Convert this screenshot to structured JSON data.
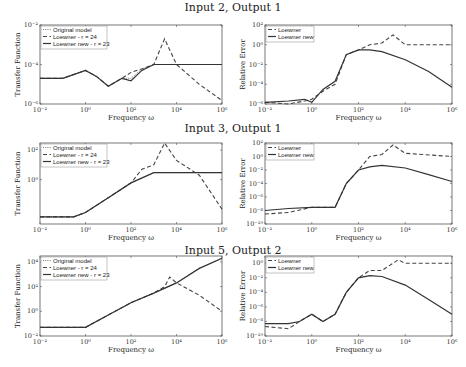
{
  "figure": {
    "rows": [
      {
        "title": "Input 2, Output 1"
      },
      {
        "title": "Input 3, Output 1"
      },
      {
        "title": "Input 5, Output 2"
      }
    ],
    "xlabel": "Frequency ω",
    "left_ylabel": "Transfer Function",
    "right_ylabel": "Relative Error",
    "left_legend": [
      "Original model",
      "Loewner - r = 24",
      "Loewner new - r = 23"
    ],
    "right_legend": [
      "Loewner",
      "Loewner new"
    ],
    "x_ticks": [
      "10⁻²",
      "10⁰",
      "10²",
      "10⁴",
      "10⁶"
    ]
  },
  "chart_data": [
    {
      "type": "line",
      "title": "Input 2, Output 1",
      "xlabel": "Frequency ω",
      "ylabel": "Transfer Function",
      "xscale": "log",
      "yscale": "log",
      "xlim": [
        0.01,
        1000000
      ],
      "ylim": [
        1e-06,
        0.01
      ],
      "y_ticks": [
        "10⁻⁶",
        "10⁻⁴",
        "10⁻²"
      ],
      "legend": [
        "Original model",
        "Loewner - r = 24",
        "Loewner new - r = 23"
      ],
      "legend_position": "upper left",
      "series": [
        {
          "name": "Original model",
          "style": "dotted",
          "x": [
            0.01,
            0.1,
            1,
            3,
            10,
            40,
            100,
            300,
            1000,
            10000,
            1000000
          ],
          "y": [
            2e-05,
            2e-05,
            5e-05,
            2.5e-05,
            8e-06,
            2e-05,
            2e-05,
            6e-05,
            0.0001,
            0.0001,
            0.0001
          ]
        },
        {
          "name": "Loewner - r = 24",
          "style": "dashed",
          "x": [
            0.01,
            0.1,
            1,
            3,
            10,
            40,
            100,
            300,
            1000,
            3000,
            10000,
            100000,
            1000000
          ],
          "y": [
            2e-05,
            2e-05,
            5e-05,
            2.5e-05,
            8e-06,
            2e-05,
            4e-05,
            6e-05,
            0.0001,
            0.002,
            0.0001,
            1e-05,
            1.5e-06
          ]
        },
        {
          "name": "Loewner new - r = 23",
          "style": "solid",
          "x": [
            0.01,
            0.1,
            1,
            3,
            10,
            40,
            100,
            300,
            1000,
            10000,
            1000000
          ],
          "y": [
            2e-05,
            2e-05,
            5e-05,
            2.5e-05,
            8e-06,
            2e-05,
            1.5e-05,
            5e-05,
            0.0001,
            0.0001,
            0.0001
          ]
        }
      ]
    },
    {
      "type": "line",
      "title": "Input 2, Output 1",
      "xlabel": "Frequency ω",
      "ylabel": "Relative Error",
      "xscale": "log",
      "yscale": "log",
      "xlim": [
        0.01,
        1000000
      ],
      "ylim": [
        1e-06,
        100
      ],
      "y_ticks": [
        "10⁻⁶",
        "10⁻⁴",
        "10⁻²",
        "10⁰",
        "10²"
      ],
      "legend": [
        "Loewner",
        "Loewner new"
      ],
      "legend_position": "upper left",
      "series": [
        {
          "name": "Loewner",
          "style": "dashed",
          "x": [
            0.01,
            0.1,
            0.5,
            1,
            3,
            10,
            30,
            100,
            300,
            1000,
            3000,
            10000,
            1000000
          ],
          "y": [
            1.5e-06,
            1e-06,
            2e-06,
            3e-06,
            2e-05,
            0.0001,
            0.1,
            0.3,
            1,
            1.5,
            10,
            1,
            1
          ]
        },
        {
          "name": "Loewner new",
          "style": "solid",
          "x": [
            0.01,
            0.1,
            0.5,
            1,
            3,
            10,
            30,
            100,
            300,
            1000,
            10000,
            100000,
            1000000
          ],
          "y": [
            1.5e-06,
            2e-06,
            3e-06,
            1.5e-06,
            3e-05,
            0.0002,
            0.1,
            0.3,
            0.3,
            0.2,
            0.03,
            0.002,
            5e-05
          ]
        }
      ]
    },
    {
      "type": "line",
      "title": "Input 3, Output 1",
      "xlabel": "Frequency ω",
      "ylabel": "Transfer Function",
      "xscale": "log",
      "yscale": "log",
      "xlim": [
        0.01,
        1000000
      ],
      "ylim": [
        0.001,
        300
      ],
      "y_ticks": [
        "10⁰",
        "10²"
      ],
      "legend": [
        "Original model",
        "Loewner - r = 24",
        "Loewner new - r = 23"
      ],
      "legend_position": "upper left",
      "series": [
        {
          "name": "Original model",
          "style": "dotted",
          "x": [
            0.01,
            0.3,
            1,
            10,
            100,
            1000,
            10000,
            1000000
          ],
          "y": [
            0.003,
            0.003,
            0.006,
            0.06,
            0.6,
            3,
            3,
            3
          ]
        },
        {
          "name": "Loewner - r = 24",
          "style": "dashed",
          "x": [
            0.01,
            0.3,
            1,
            10,
            100,
            300,
            1000,
            3000,
            10000,
            100000,
            1000000
          ],
          "y": [
            0.003,
            0.003,
            0.006,
            0.06,
            0.6,
            5,
            10,
            300,
            20,
            2,
            0.01
          ]
        },
        {
          "name": "Loewner new - r = 23",
          "style": "solid",
          "x": [
            0.01,
            0.3,
            1,
            10,
            100,
            1000,
            10000,
            1000000
          ],
          "y": [
            0.003,
            0.003,
            0.006,
            0.06,
            0.6,
            3,
            3,
            3
          ]
        }
      ]
    },
    {
      "type": "line",
      "title": "Input 3, Output 1",
      "xlabel": "Frequency ω",
      "ylabel": "Relative Error",
      "xscale": "log",
      "yscale": "log",
      "xlim": [
        0.01,
        1000000
      ],
      "ylim": [
        1e-10,
        100
      ],
      "y_ticks": [
        "10⁻¹⁰",
        "10⁻⁸",
        "10⁻⁶",
        "10⁻⁴",
        "10⁻²",
        "10⁰",
        "10²"
      ],
      "legend": [
        "Loewner",
        "Loewner new"
      ],
      "legend_position": "upper left",
      "series": [
        {
          "name": "Loewner",
          "style": "dashed",
          "x": [
            0.01,
            0.1,
            1,
            10,
            30,
            100,
            300,
            1000,
            3000,
            10000,
            1000000
          ],
          "y": [
            3e-09,
            5e-09,
            3e-08,
            3e-08,
            0.0001,
            0.01,
            1,
            2,
            50,
            3,
            1
          ]
        },
        {
          "name": "Loewner new",
          "style": "solid",
          "x": [
            0.01,
            0.1,
            1,
            10,
            30,
            100,
            300,
            1000,
            10000,
            100000,
            1000000
          ],
          "y": [
            1e-08,
            2e-08,
            3e-08,
            3e-08,
            0.0001,
            0.01,
            0.03,
            0.05,
            0.02,
            0.002,
            0.0002
          ]
        }
      ]
    },
    {
      "type": "line",
      "title": "Input 5, Output 2",
      "xlabel": "Frequency ω",
      "ylabel": "Transfer Function",
      "xscale": "log",
      "yscale": "log",
      "xlim": [
        0.01,
        1000000
      ],
      "ylim": [
        0.01,
        30000
      ],
      "y_ticks": [
        "10⁻²",
        "10⁰",
        "10²",
        "10⁴"
      ],
      "legend": [
        "Original model",
        "Loewner - r = 24",
        "Loewner new - r = 23"
      ],
      "legend_position": "upper left",
      "series": [
        {
          "name": "Original model",
          "style": "dotted",
          "x": [
            0.01,
            1,
            10,
            100,
            1000,
            10000,
            100000,
            1000000
          ],
          "y": [
            0.05,
            0.05,
            0.5,
            5,
            30,
            200,
            3000,
            20000
          ]
        },
        {
          "name": "Loewner - r = 24",
          "style": "dashed",
          "x": [
            0.01,
            1,
            10,
            100,
            1000,
            3000,
            5000,
            10000,
            100000,
            1000000
          ],
          "y": [
            0.05,
            0.05,
            0.5,
            5,
            30,
            100,
            600,
            200,
            20,
            1
          ]
        },
        {
          "name": "Loewner new - r = 23",
          "style": "solid",
          "x": [
            0.01,
            1,
            10,
            100,
            1000,
            10000,
            100000,
            1000000
          ],
          "y": [
            0.05,
            0.05,
            0.5,
            5,
            30,
            200,
            3000,
            20000
          ]
        }
      ]
    },
    {
      "type": "line",
      "title": "Input 5, Output 2",
      "xlabel": "Frequency ω",
      "ylabel": "Relative Error",
      "xscale": "log",
      "yscale": "log",
      "xlim": [
        0.01,
        1000000
      ],
      "ylim": [
        1e-10,
        10
      ],
      "y_ticks": [
        "10⁻¹⁰",
        "10⁻⁸",
        "10⁻⁶",
        "10⁻⁴",
        "10⁻²",
        "10⁰"
      ],
      "legend": [
        "Loewner",
        "Loewner new"
      ],
      "legend_position": "upper left",
      "series": [
        {
          "name": "Loewner",
          "style": "dashed",
          "x": [
            0.01,
            0.1,
            0.3,
            1,
            3,
            10,
            30,
            100,
            300,
            1000,
            5000,
            10000,
            1000000
          ],
          "y": [
            2e-09,
            1e-09,
            1e-08,
            1e-07,
            1e-08,
            1e-07,
            0.0001,
            0.01,
            0.1,
            0.1,
            3,
            1,
            1
          ]
        },
        {
          "name": "Loewner new",
          "style": "solid",
          "x": [
            0.01,
            0.1,
            0.3,
            1,
            3,
            10,
            30,
            100,
            300,
            1000,
            10000,
            100000,
            1000000
          ],
          "y": [
            5e-09,
            5e-09,
            1e-08,
            1e-07,
            1e-08,
            1e-07,
            0.0001,
            0.01,
            0.02,
            0.015,
            0.001,
            1e-05,
            1e-07
          ]
        }
      ]
    }
  ]
}
